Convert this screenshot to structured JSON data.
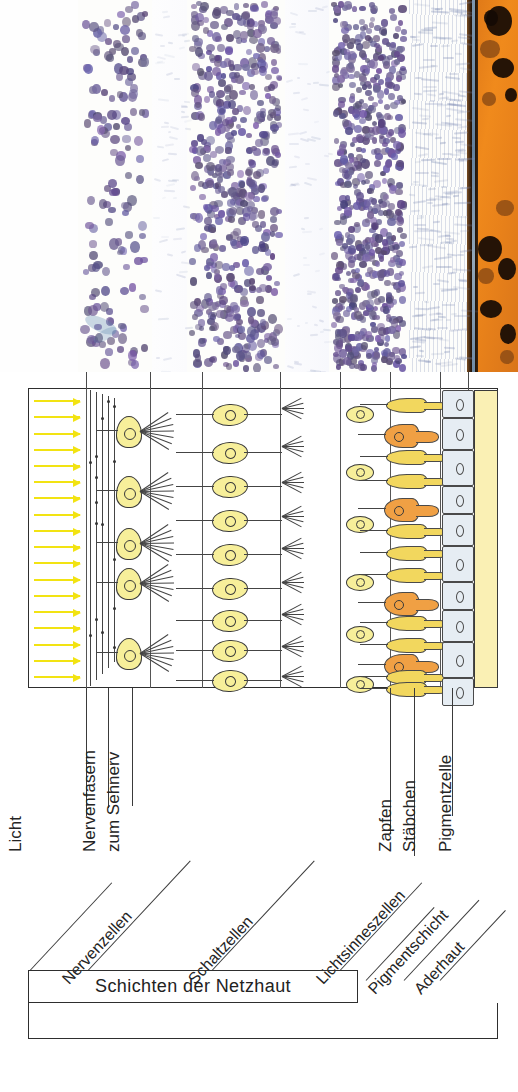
{
  "figure": {
    "kind": "retina-layers-diagram",
    "language": "de",
    "panels": [
      "light-micrograph-of-retina",
      "schematic-of-retinal-layers"
    ]
  },
  "micrograph": {
    "description": "Histologischer Schnitt durch die Netzhaut, Haematoxylin-Faerbung",
    "bands": [
      {
        "name": "Nervenfaserschicht",
        "nuclei": "none"
      },
      {
        "name": "Ganglienzellschicht",
        "nuclei": "sparse"
      },
      {
        "name": "innere plexiforme Schicht",
        "nuclei": "none"
      },
      {
        "name": "innere Koernerschicht",
        "nuclei": "dense"
      },
      {
        "name": "aeussere plexiforme Schicht",
        "nuclei": "none"
      },
      {
        "name": "aeussere Koernerschicht",
        "nuclei": "very-dense"
      },
      {
        "name": "Stäbchen- und Zapfenaussenglieder",
        "nuclei": "none"
      },
      {
        "name": "Pigmentepithel",
        "nuclei": "none"
      },
      {
        "name": "Aderhaut",
        "nuclei": "none"
      }
    ]
  },
  "diagram": {
    "light_label": "Licht",
    "arrow_color": "#f2e312",
    "arrow_count": 18,
    "cell_colors": {
      "ganglion": "#f7ef9a",
      "bipolar": "#f7ef9a",
      "rod": "#f2d75e",
      "cone": "#f0a044",
      "pigment_cell": "#e6edf3",
      "choroid": "#faf0b4"
    },
    "counts": {
      "ganglion_cells": 5,
      "bipolar_cells": 9,
      "horizontal_cells": 8,
      "rods": 10,
      "cones": 5,
      "pigment_cells": 10
    }
  },
  "labels": {
    "vertical": [
      {
        "id": "licht",
        "text": "Licht"
      },
      {
        "id": "nervenfasern",
        "text": "Nervenfasern"
      },
      {
        "id": "zum-sehnerv",
        "text": "zum Sehnerv"
      },
      {
        "id": "zapfen",
        "text": "Zapfen"
      },
      {
        "id": "staebchen",
        "text": "Stäbchen"
      },
      {
        "id": "pigmentzelle",
        "text": "Pigmentzelle"
      }
    ],
    "diagonal": [
      {
        "id": "nervenzellen",
        "text": "Nervenzellen"
      },
      {
        "id": "schaltzellen",
        "text": "Schaltzellen"
      },
      {
        "id": "lichtsinneszellen",
        "text": "Lichtsinneszellen"
      },
      {
        "id": "pigmentschicht",
        "text": "Pigmentschicht"
      },
      {
        "id": "aderhaut",
        "text": "Aderhaut"
      }
    ],
    "bracket": {
      "text": "Schichten der Netzhaut"
    }
  },
  "caption": {
    "text": ""
  }
}
